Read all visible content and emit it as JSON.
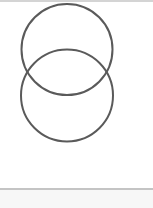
{
  "diagram": {
    "type": "overlapping-circles",
    "stroke_color": "#5a5a5a",
    "stroke_width": 2,
    "circles": [
      {
        "name": "upper",
        "cx": 67,
        "cy": 49.5,
        "r": 45.5
      },
      {
        "name": "lower",
        "cx": 67,
        "cy": 95.5,
        "r": 46
      }
    ]
  },
  "colors": {
    "background": "#ffffff",
    "border": "#d4d4d4",
    "separator": "#c4c4c4",
    "footer": "#f7f7f7"
  }
}
